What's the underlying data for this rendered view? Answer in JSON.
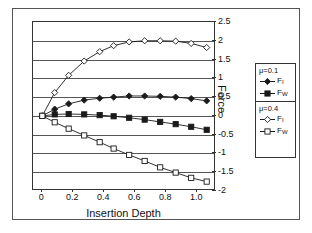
{
  "chart_data": {
    "type": "line",
    "title": "",
    "xlabel": "Insertion Depth",
    "ylabel": "Force",
    "xlim": [
      -0.06,
      1.12
    ],
    "ylim": [
      -2,
      2.5
    ],
    "xticks": [
      "0",
      "0.2",
      "0.4",
      "0.6",
      "0.8",
      "1.0"
    ],
    "xtick_values": [
      0,
      0.2,
      0.4,
      0.6,
      0.8,
      1.0
    ],
    "yticks": [
      "2.5",
      "2",
      "1.5",
      "1",
      "0.5",
      "0",
      "-0.5",
      "-1",
      "-1.5",
      "-2"
    ],
    "ytick_values": [
      2.5,
      2,
      1.5,
      1,
      0.5,
      0,
      -0.5,
      -1,
      -1.5,
      -2
    ],
    "grid": true,
    "grid_axis": "y",
    "legend_position": "right-outside",
    "x": [
      0,
      0.08,
      0.17,
      0.27,
      0.37,
      0.46,
      0.56,
      0.66,
      0.76,
      0.86,
      0.96,
      1.06
    ],
    "series": [
      {
        "name": "F_I (mu=0.1)",
        "label": "F",
        "sublabel": "I",
        "group": "mu=0.1",
        "marker": "filled-diamond",
        "values": [
          0,
          0.18,
          0.32,
          0.42,
          0.47,
          0.5,
          0.53,
          0.53,
          0.52,
          0.5,
          0.46,
          0.4
        ]
      },
      {
        "name": "F_W (mu=0.1)",
        "label": "F",
        "sublabel": "W",
        "group": "mu=0.1",
        "marker": "filled-square",
        "values": [
          0,
          0.04,
          0.05,
          0.04,
          0.02,
          -0.01,
          -0.05,
          -0.1,
          -0.16,
          -0.22,
          -0.29,
          -0.37
        ]
      },
      {
        "name": "F_I (mu=0.4)",
        "label": "F",
        "sublabel": "I",
        "group": "mu=0.4",
        "marker": "open-diamond",
        "values": [
          0,
          0.62,
          1.08,
          1.46,
          1.71,
          1.87,
          1.97,
          2.0,
          2.0,
          1.99,
          1.93,
          1.82
        ]
      },
      {
        "name": "F_W (mu=0.4)",
        "label": "F",
        "sublabel": "W",
        "group": "mu=0.4",
        "marker": "open-square",
        "values": [
          0,
          -0.17,
          -0.34,
          -0.52,
          -0.7,
          -0.87,
          -1.04,
          -1.2,
          -1.37,
          -1.51,
          -1.65,
          -1.75
        ]
      }
    ]
  },
  "axes": {
    "x_title": "Insertion Depth",
    "y_title": "Force"
  },
  "legend": {
    "groups": [
      {
        "header": "μ=0.1",
        "entries": [
          {
            "label": "F",
            "sub": "I",
            "marker": "filled-diamond"
          },
          {
            "label": "F",
            "sub": "W",
            "marker": "filled-square"
          }
        ]
      },
      {
        "header": "μ=0.4",
        "entries": [
          {
            "label": "F",
            "sub": "I",
            "marker": "open-diamond"
          },
          {
            "label": "F",
            "sub": "W",
            "marker": "open-square"
          }
        ]
      }
    ]
  },
  "colors": {
    "line": "#1a1a1a",
    "grid": "#555555",
    "frame": "#333333",
    "background": "#ffffff"
  }
}
